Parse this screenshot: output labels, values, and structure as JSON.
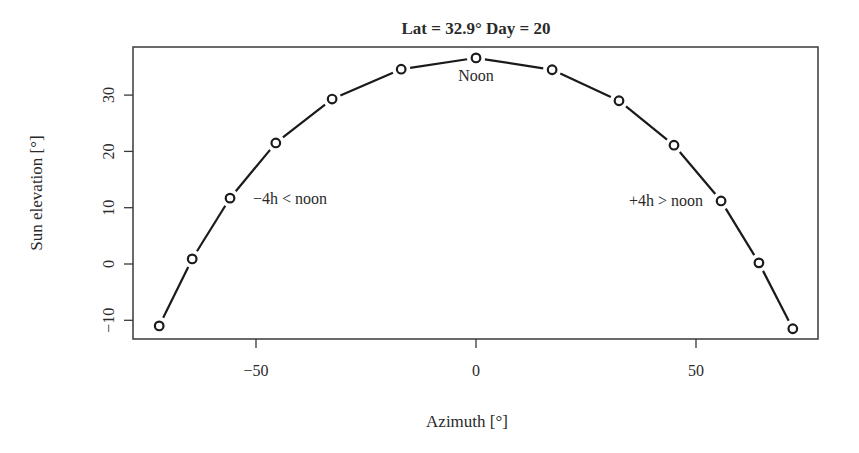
{
  "chart_data": {
    "type": "line",
    "title": "Lat =  32.9° Day =  20",
    "xlabel": "Azimuth [°]",
    "ylabel": "Sun elevation [°]",
    "xlim": [
      -75.5,
      80
    ],
    "ylim": [
      -13.3,
      38.5
    ],
    "x_ticks": [
      -50,
      0,
      50
    ],
    "x_tick_labels": [
      "−50",
      "0",
      "50"
    ],
    "y_ticks": [
      -10,
      0,
      10,
      20,
      30
    ],
    "y_tick_labels": [
      "−10",
      "0",
      "10",
      "20",
      "30"
    ],
    "grid": false,
    "legend": null,
    "series": [
      {
        "name": "Sun path",
        "marker": "open-circle",
        "line": true,
        "x": [
          -72.0,
          -64.5,
          -55.9,
          -45.5,
          -32.7,
          -17.0,
          0.0,
          17.3,
          32.5,
          45.0,
          55.7,
          64.3,
          72.0
        ],
        "y": [
          -11.0,
          0.9,
          11.7,
          21.5,
          29.3,
          34.6,
          36.6,
          34.5,
          29.0,
          21.1,
          11.2,
          0.2,
          -11.5
        ]
      }
    ],
    "annotations": [
      {
        "text": "Noon",
        "x": 0,
        "y": 34.0
      },
      {
        "text": "−4h < noon",
        "x": -46,
        "y": 11.7
      },
      {
        "text": "+4h > noon",
        "x": 40,
        "y": 11.2
      }
    ]
  },
  "colors": {
    "line": "#1a1a1a",
    "axis": "#3a3a3a",
    "text": "#2a2a2a",
    "background": "#ffffff"
  }
}
